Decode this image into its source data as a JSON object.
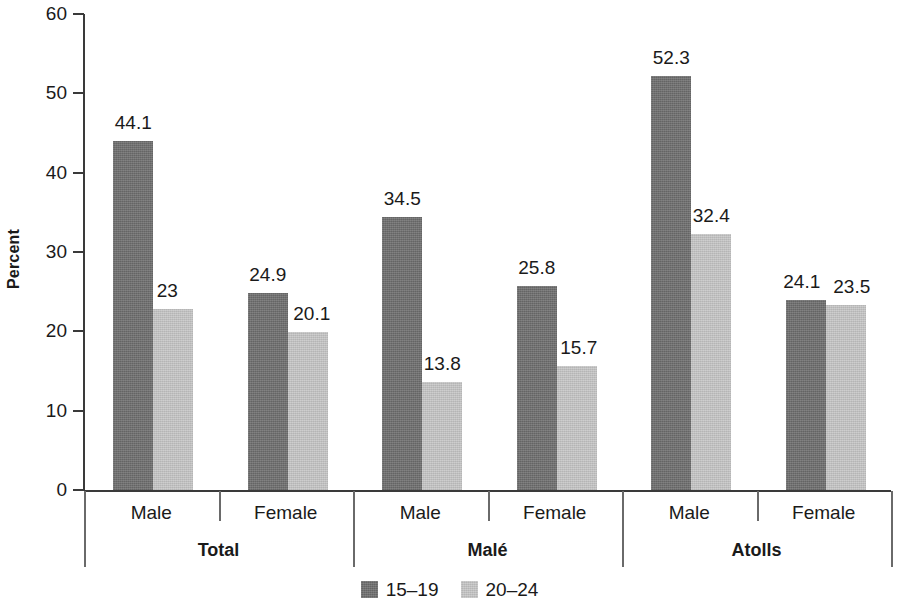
{
  "chart_data": {
    "type": "bar",
    "title": "",
    "subtitle": "",
    "xlabel": "",
    "ylabel": "Percent",
    "ylim": [
      0,
      60
    ],
    "ytick_labels": [
      "60",
      "50",
      "40",
      "30",
      "20",
      "10",
      "0"
    ],
    "ytick_values": [
      60,
      50,
      40,
      30,
      20,
      10,
      0
    ],
    "grid": false,
    "legend_position": "bottom-center",
    "groups": [
      "Total",
      "Malé",
      "Atolls"
    ],
    "categories": [
      "Male",
      "Female",
      "Male",
      "Female",
      "Male",
      "Female"
    ],
    "series": [
      {
        "name": "15–19",
        "color": "#6f6f6f",
        "values": [
          44.1,
          24.9,
          34.5,
          25.8,
          52.3,
          24.1
        ],
        "labels": [
          "44.1",
          "24.9",
          "34.5",
          "25.8",
          "52.3",
          "24.1"
        ]
      },
      {
        "name": "20–24",
        "color": "#c7c7c7",
        "values": [
          23,
          20.1,
          13.8,
          15.7,
          32.4,
          23.5
        ],
        "labels": [
          "23",
          "20.1",
          "13.8",
          "15.7",
          "32.4",
          "23.5"
        ]
      }
    ]
  },
  "axis": {
    "y_title": "Percent",
    "ticks": [
      {
        "label": "60",
        "value": 60
      },
      {
        "label": "50",
        "value": 50
      },
      {
        "label": "40",
        "value": 40
      },
      {
        "label": "30",
        "value": 30
      },
      {
        "label": "20",
        "value": 20
      },
      {
        "label": "10",
        "value": 10
      },
      {
        "label": "0",
        "value": 0
      }
    ]
  },
  "x_axis": {
    "categories": [
      {
        "label": "Male"
      },
      {
        "label": "Female"
      },
      {
        "label": "Male"
      },
      {
        "label": "Female"
      },
      {
        "label": "Male"
      },
      {
        "label": "Female"
      }
    ],
    "groups": [
      {
        "label": "Total"
      },
      {
        "label": "Malé"
      },
      {
        "label": "Atolls"
      }
    ]
  },
  "legend": {
    "items": [
      {
        "label": "15–19",
        "color": "#6f6f6f"
      },
      {
        "label": "20–24",
        "color": "#c7c7c7"
      }
    ]
  }
}
